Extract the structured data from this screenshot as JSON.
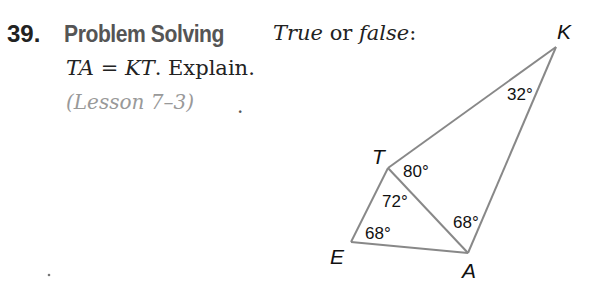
{
  "problem": {
    "number": "39.",
    "heading": "Problem Solving",
    "prompt_true": "True",
    "prompt_or": " or ",
    "prompt_false": "false",
    "prompt_colon": ":",
    "statement_lhs": "TA",
    "statement_eq": " = ",
    "statement_rhs": "KT",
    "statement_tail": ". Explain.",
    "lesson_ref": "(Lesson 7–3)",
    "stray_mark": "."
  },
  "figure": {
    "vertices": {
      "K": {
        "label": "K"
      },
      "T": {
        "label": "T"
      },
      "E": {
        "label": "E"
      },
      "A": {
        "label": "A"
      }
    },
    "angles": {
      "K": "32°",
      "KTA": "80°",
      "ETA": "72°",
      "E": "68°",
      "KAT": "68°"
    },
    "stroke_color": "#888888"
  }
}
